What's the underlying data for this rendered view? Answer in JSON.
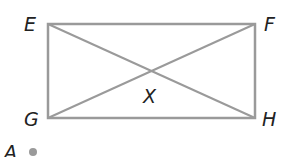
{
  "diagram": {
    "type": "rectangle-with-diagonals",
    "line_color": "#9a9a9a",
    "text_color": "#222222",
    "points": {
      "E": {
        "label": "E",
        "x": 48,
        "y": 24
      },
      "F": {
        "label": "F",
        "x": 255,
        "y": 24
      },
      "G": {
        "label": "G",
        "x": 48,
        "y": 118
      },
      "H": {
        "label": "H",
        "x": 255,
        "y": 118
      },
      "X": {
        "label": "X",
        "x": 151,
        "y": 71
      },
      "A": {
        "label": "A",
        "x": 33,
        "y": 152
      }
    },
    "segments": [
      "EF",
      "FH",
      "HG",
      "GE",
      "EH",
      "FG"
    ]
  }
}
